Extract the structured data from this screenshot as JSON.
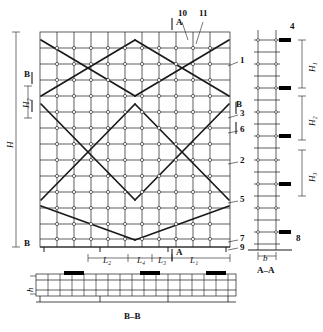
{
  "figure": {
    "views": [
      {
        "name": "main-elevation",
        "caption": ""
      },
      {
        "name": "section-a-a",
        "caption": "A–A"
      },
      {
        "name": "section-b-b",
        "caption": "B–B"
      }
    ]
  },
  "callouts": [
    {
      "id": "1",
      "x": 242,
      "y": 60
    },
    {
      "id": "2",
      "x": 242,
      "y": 160
    },
    {
      "id": "3",
      "x": 242,
      "y": 113
    },
    {
      "id": "4",
      "x": 289,
      "y": 28
    },
    {
      "id": "5",
      "x": 242,
      "y": 199
    },
    {
      "id": "6",
      "x": 242,
      "y": 129
    },
    {
      "id": "7",
      "x": 242,
      "y": 238
    },
    {
      "id": "8",
      "x": 294,
      "y": 238
    },
    {
      "id": "9",
      "x": 242,
      "y": 246
    },
    {
      "id": "10",
      "x": 180,
      "y": 14
    },
    {
      "id": "11",
      "x": 201,
      "y": 14
    }
  ],
  "dimensions": {
    "overall_height": "H",
    "height_h1": "H₁",
    "height_h2": "H₂",
    "height_h3": "H₃",
    "small_h": "h",
    "span_l1": "L₁",
    "span_l2": "L₂",
    "span_l3": "L₃",
    "span_l4": "L₄",
    "span_b": "b"
  },
  "section_marks": {
    "a_top": "A",
    "a_bottom": "A",
    "b_left_top": "B",
    "b_left_bottom": "B",
    "b_right_top": "B",
    "b_right_bottom": "B"
  },
  "captions": {
    "section_aa": "A–A",
    "section_bb": "B–B"
  },
  "colors": {
    "line": "#1a1a1a",
    "fill": "#ffffff",
    "node": "#ffffff",
    "solid": "#000000"
  }
}
